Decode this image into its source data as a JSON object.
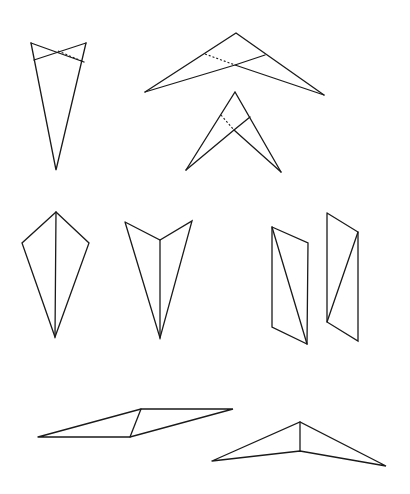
{
  "figure": {
    "width": 410,
    "height": 494,
    "background": "#ffffff",
    "stroke_color": "#1a1a1a",
    "shapes": [
      {
        "id": "folded-kite-narrow",
        "solid": [
          [
            [
              31,
              43
            ],
            [
              56,
              170
            ],
            [
              86,
              43
            ]
          ],
          [
            [
              31,
              43
            ],
            [
              84,
              62
            ]
          ],
          [
            [
              86,
              43
            ],
            [
              34,
              60
            ]
          ]
        ],
        "dashed": [
          [
            [
              58,
              51
            ],
            [
              84,
              62
            ]
          ]
        ]
      },
      {
        "id": "wide-folded-chevron",
        "solid": [
          [
            [
              145,
              92
            ],
            [
              236,
              33
            ],
            [
              324,
              95
            ]
          ],
          [
            [
              145,
              92
            ],
            [
              235,
              65
            ],
            [
              265,
              55
            ]
          ],
          [
            [
              324,
              95
            ],
            [
              235,
              65
            ]
          ]
        ],
        "dashed": [
          [
            [
              205,
              54
            ],
            [
              235,
              65
            ]
          ]
        ]
      },
      {
        "id": "narrow-folded-chevron",
        "solid": [
          [
            [
              186,
              170
            ],
            [
              235,
              92
            ],
            [
              281,
              172
            ]
          ],
          [
            [
              186,
              170
            ],
            [
              234,
              130
            ],
            [
              250,
              117
            ]
          ],
          [
            [
              281,
              172
            ],
            [
              234,
              130
            ]
          ]
        ],
        "dashed": [
          [
            [
              221,
              115
            ],
            [
              234,
              130
            ]
          ]
        ]
      },
      {
        "id": "kite-with-spine",
        "solid": [
          [
            [
              56,
              212
            ],
            [
              22,
              243
            ],
            [
              55,
              337
            ],
            [
              89,
              243
            ],
            [
              56,
              212
            ]
          ],
          [
            [
              56,
              212
            ],
            [
              55,
              337
            ]
          ]
        ],
        "dashed": []
      },
      {
        "id": "arrowhead-with-spine",
        "solid": [
          [
            [
              125,
              222
            ],
            [
              160,
              240
            ],
            [
              192,
              221
            ],
            [
              160,
              338
            ],
            [
              125,
              222
            ]
          ],
          [
            [
              160,
              240
            ],
            [
              160,
              338
            ]
          ]
        ],
        "dashed": []
      },
      {
        "id": "parallelogram-left",
        "solid": [
          [
            [
              272,
              227
            ],
            [
              308,
              243
            ],
            [
              307,
              344
            ],
            [
              272,
              327
            ],
            [
              272,
              227
            ]
          ],
          [
            [
              272,
              227
            ],
            [
              307,
              344
            ]
          ]
        ],
        "dashed": []
      },
      {
        "id": "parallelogram-right",
        "solid": [
          [
            [
              327,
              213
            ],
            [
              358,
              232
            ],
            [
              358,
              341
            ],
            [
              327,
              322
            ],
            [
              327,
              213
            ]
          ],
          [
            [
              358,
              232
            ],
            [
              327,
              322
            ]
          ]
        ],
        "dashed": []
      },
      {
        "id": "flat-parallelogram",
        "solid": [
          [
            [
              38,
              437
            ],
            [
              141,
              409
            ],
            [
              233,
              409
            ],
            [
              130,
              437
            ],
            [
              38,
              437
            ]
          ],
          [
            [
              141,
              409
            ],
            [
              130,
              437
            ]
          ]
        ],
        "dashed": []
      },
      {
        "id": "flat-dart",
        "solid": [
          [
            [
              212,
              461
            ],
            [
              300,
              422
            ],
            [
              386,
              466
            ],
            [
              300,
              451
            ],
            [
              212,
              461
            ]
          ],
          [
            [
              300,
              422
            ],
            [
              300,
              451
            ]
          ]
        ],
        "dashed": []
      }
    ]
  }
}
